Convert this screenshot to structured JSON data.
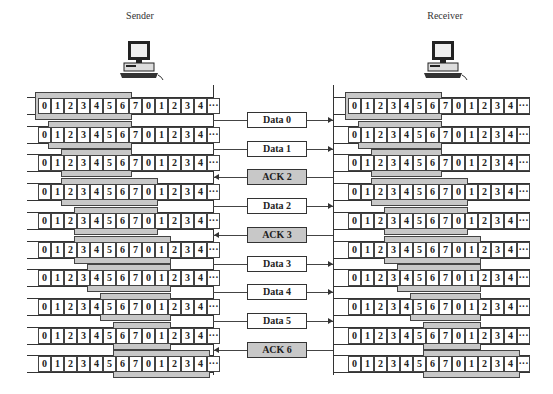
{
  "sender": {
    "label": "Sender",
    "icon": "computer-icon",
    "rows": [
      {
        "window_start": 0,
        "window_end": 6
      },
      {
        "window_start": 1,
        "window_end": 6
      },
      {
        "window_start": 2,
        "window_end": 6
      },
      {
        "window_start": 2,
        "window_end": 8
      },
      {
        "window_start": 3,
        "window_end": 8
      },
      {
        "window_start": 3,
        "window_end": 9
      },
      {
        "window_start": 4,
        "window_end": 9
      },
      {
        "window_start": 5,
        "window_end": 9
      },
      {
        "window_start": 6,
        "window_end": 9
      },
      {
        "window_start": 6,
        "window_end": 12
      }
    ]
  },
  "receiver": {
    "label": "Receiver",
    "icon": "computer-icon",
    "rows": [
      {
        "window_start": 0,
        "window_end": 6
      },
      {
        "window_start": 1,
        "window_end": 6
      },
      {
        "window_start": 2,
        "window_end": 6
      },
      {
        "window_start": 2,
        "window_end": 8
      },
      {
        "window_start": 3,
        "window_end": 8
      },
      {
        "window_start": 3,
        "window_end": 9
      },
      {
        "window_start": 4,
        "window_end": 9
      },
      {
        "window_start": 5,
        "window_end": 9
      },
      {
        "window_start": 6,
        "window_end": 9
      },
      {
        "window_start": 6,
        "window_end": 12
      }
    ]
  },
  "sequence": [
    "0",
    "1",
    "2",
    "3",
    "4",
    "5",
    "6",
    "7",
    "0",
    "1",
    "2",
    "3",
    "4",
    "···"
  ],
  "messages": [
    {
      "label": "Data 0",
      "type": "data",
      "direction": "right",
      "row_gap": 0
    },
    {
      "label": "Data 1",
      "type": "data",
      "direction": "right",
      "row_gap": 1
    },
    {
      "label": "ACK 2",
      "type": "ack",
      "direction": "left",
      "row_gap": 2
    },
    {
      "label": "Data 2",
      "type": "data",
      "direction": "right",
      "row_gap": 3
    },
    {
      "label": "ACK 3",
      "type": "ack",
      "direction": "left",
      "row_gap": 4
    },
    {
      "label": "Data 3",
      "type": "data",
      "direction": "right",
      "row_gap": 5
    },
    {
      "label": "Data 4",
      "type": "data",
      "direction": "right",
      "row_gap": 6
    },
    {
      "label": "Data 5",
      "type": "data",
      "direction": "right",
      "row_gap": 7
    },
    {
      "label": "ACK 6",
      "type": "ack",
      "direction": "left",
      "row_gap": 8
    }
  ],
  "colors": {
    "window_fill": "#c8c8c8",
    "ack_fill": "#c8c8c8",
    "line": "#333333"
  }
}
